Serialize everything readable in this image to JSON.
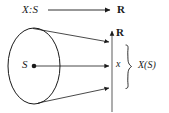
{
  "figure": {
    "background_color": "#ffffff",
    "ink_color": "#1a1a1a",
    "width": 169,
    "height": 113
  },
  "labels": {
    "mapping": "X:S",
    "codomain_top": "R",
    "codomain_axis": "R",
    "sample_space": "S",
    "point_image": "x",
    "image_set": "X(S)"
  },
  "elements": {
    "ellipse_name": "sample-space-ellipse",
    "center_dot_name": "sample-space-center-dot",
    "real_line_name": "real-line-axis",
    "brace_name": "image-range-brace",
    "top_arrow_name": "mapping-arrow",
    "cone_upper_name": "cone-upper-edge",
    "cone_lower_name": "cone-lower-edge",
    "center_arrow_name": "center-mapping-arrow"
  },
  "geometry": {
    "ellipse": {
      "cx": 34,
      "cy": 66,
      "rx": 26,
      "ry": 38
    },
    "center_dot": {
      "cx": 34,
      "cy": 66,
      "r": 2.2
    },
    "real_line": {
      "x": 112,
      "y_top": 32,
      "y_bottom": 112
    },
    "top_arrow": {
      "x1": 48,
      "y1": 10,
      "x2": 111,
      "y2": 10
    },
    "cone_upper": {
      "x1": 33,
      "y1": 28,
      "x2": 110,
      "y2": 42
    },
    "cone_lower": {
      "x1": 38,
      "y1": 103,
      "x2": 110,
      "y2": 88
    },
    "center_arrow": {
      "x1": 36,
      "y1": 66,
      "x2": 110,
      "y2": 66
    },
    "brace": {
      "x": 126,
      "y_top": 45,
      "y_bottom": 90,
      "tip_y": 67
    }
  }
}
